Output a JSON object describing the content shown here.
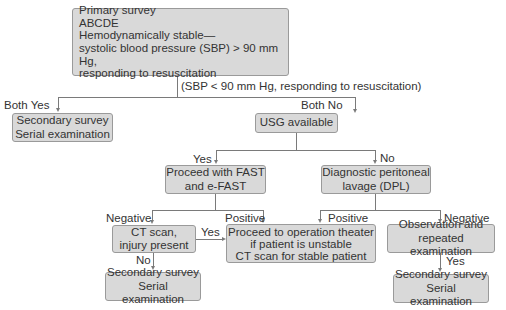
{
  "nodes": {
    "primary": {
      "lines": [
        "Primary survey",
        "ABCDE",
        "Hemodynamically stable—",
        "systolic blood pressure (SBP) > 90 mm Hg,",
        "responding to resuscitation"
      ]
    },
    "secondary_left": {
      "lines": [
        "Secondary survey",
        "Serial examination"
      ]
    },
    "usg": {
      "lines": [
        "USG available"
      ]
    },
    "fast": {
      "lines": [
        "Proceed with FAST",
        "and e-FAST"
      ]
    },
    "dpl": {
      "lines": [
        "Diagnostic peritoneal",
        "lavage (DPL)"
      ]
    },
    "ct": {
      "lines": [
        "CT scan,",
        "injury present"
      ]
    },
    "proceed": {
      "lines": [
        "Proceed to operation theater",
        "if patient is unstable",
        "CT scan for stable patient"
      ]
    },
    "observation": {
      "lines": [
        "Observation and",
        "repeated examination"
      ]
    },
    "secondary_bottom_left": {
      "lines": [
        "Secondary survey",
        "Serial examination"
      ]
    },
    "secondary_bottom_right": {
      "lines": [
        "Secondary survey",
        "Serial examination"
      ]
    }
  },
  "edge_labels": {
    "sbp_note": "(SBP < 90 mm Hg, responding to resuscitation)",
    "both_yes": "Both Yes",
    "both_no": "Both No",
    "usg_yes": "Yes",
    "usg_no": "No",
    "fast_negative": "Negative",
    "fast_positive": "Positive",
    "dpl_positive": "Positive",
    "dpl_negative": "Negative",
    "ct_yes": "Yes",
    "ct_no": "No",
    "obs_yes": "Yes"
  },
  "colors": {
    "box_fill": "#d9d9d9",
    "box_border": "#9a9a9a",
    "line": "#7a7a7a",
    "text": "#333333"
  }
}
